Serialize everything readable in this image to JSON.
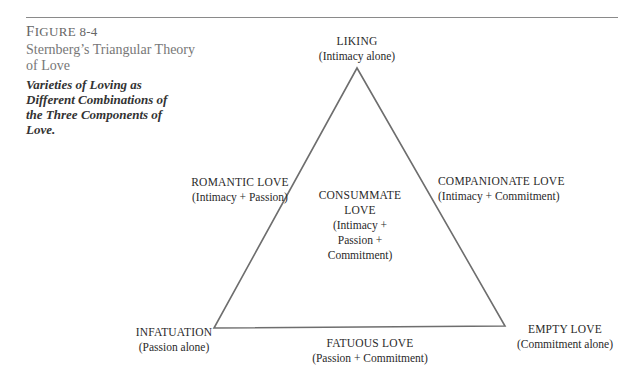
{
  "figure": {
    "label_first": "F",
    "label_rest": "IGURE 8-4",
    "title": "Sternberg’s Triangular Theory of Love",
    "caption": "Varieties of Loving as Different Combinations of the Three Components of Love."
  },
  "diagram": {
    "type": "triangle",
    "stroke_color": "#6e6e6e",
    "vertices": {
      "top": {
        "name": "LIKING",
        "sub": "(Intimacy alone)"
      },
      "bottom_left": {
        "name": "INFATUATION",
        "sub": "(Passion alone)"
      },
      "bottom_right": {
        "name": "EMPTY LOVE",
        "sub": "(Commitment alone)"
      }
    },
    "edges": {
      "left": {
        "name": "ROMANTIC LOVE",
        "sub": "(Intimacy + Passion)"
      },
      "right": {
        "name": "COMPANIONATE LOVE",
        "sub": "(Intimacy + Commitment)"
      },
      "bottom": {
        "name": "FATUOUS LOVE",
        "sub": "(Passion + Commitment)"
      }
    },
    "center": {
      "line1": "CONSUMMATE",
      "line2": "LOVE",
      "line3": "(Intimacy  +",
      "line4": "Passion +",
      "line5": "Commitment)"
    }
  }
}
